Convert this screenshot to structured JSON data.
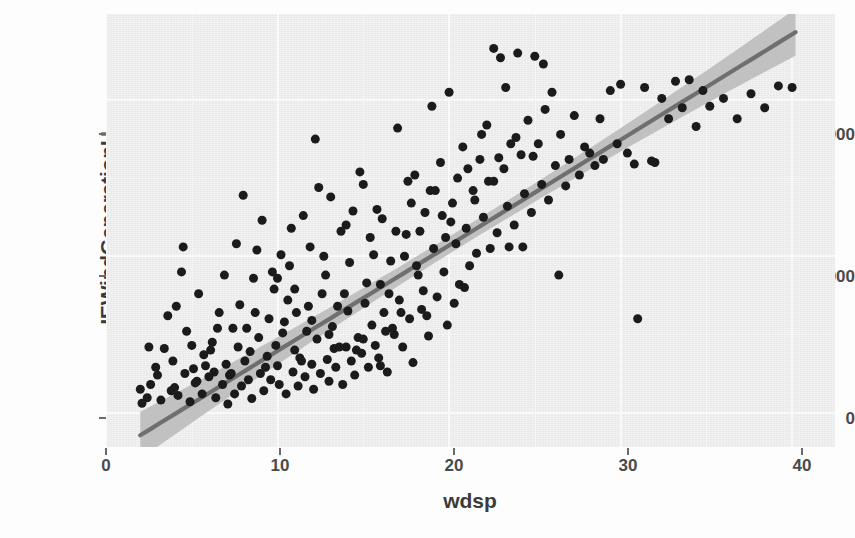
{
  "chart_data": {
    "type": "scatter",
    "title": "",
    "xlabel": "wdsp",
    "ylabel": "IEWindGenerationH",
    "xlim": [
      0,
      42.5
    ],
    "ylim": [
      -220,
      2550
    ],
    "xticks": [
      0,
      10,
      20,
      30,
      40
    ],
    "xticklabels": [
      "0",
      "10",
      "20",
      "30",
      "40"
    ],
    "yticks": [
      0,
      1000,
      2000
    ],
    "yticklabels": [
      "0",
      "1000",
      "2000"
    ],
    "grid": true,
    "legend": null,
    "panel_background": "#ececec",
    "grid_color": "#fafafa",
    "point_color": "#1b1b1b",
    "point_size": 9,
    "smooth": {
      "method": "lm",
      "line_color": "#6f6f6f",
      "ribbon_color": "#bdbdbd",
      "intercept": -280,
      "slope": 67.5,
      "x_start": 2.0,
      "x_end": 40.2,
      "se_min": 55,
      "se_max": 150
    },
    "points": [
      [
        2.0,
        150
      ],
      [
        2.1,
        60
      ],
      [
        2.4,
        95
      ],
      [
        2.6,
        180
      ],
      [
        3.0,
        240
      ],
      [
        3.2,
        80
      ],
      [
        3.6,
        620
      ],
      [
        3.9,
        330
      ],
      [
        4.0,
        160
      ],
      [
        4.2,
        110
      ],
      [
        4.4,
        900
      ],
      [
        4.6,
        250
      ],
      [
        4.9,
        70
      ],
      [
        5.0,
        430
      ],
      [
        5.2,
        190
      ],
      [
        5.4,
        760
      ],
      [
        5.6,
        120
      ],
      [
        5.8,
        300
      ],
      [
        6.0,
        230
      ],
      [
        6.2,
        450
      ],
      [
        6.4,
        95
      ],
      [
        6.6,
        640
      ],
      [
        6.8,
        180
      ],
      [
        7.0,
        310
      ],
      [
        7.1,
        55
      ],
      [
        7.3,
        250
      ],
      [
        7.5,
        120
      ],
      [
        7.7,
        420
      ],
      [
        7.9,
        170
      ],
      [
        8.0,
        1390
      ],
      [
        8.1,
        330
      ],
      [
        8.3,
        210
      ],
      [
        8.5,
        90
      ],
      [
        8.7,
        640
      ],
      [
        8.9,
        480
      ],
      [
        9.0,
        250
      ],
      [
        9.2,
        140
      ],
      [
        9.4,
        360
      ],
      [
        9.6,
        210
      ],
      [
        9.8,
        790
      ],
      [
        10.0,
        300
      ],
      [
        10.1,
        180
      ],
      [
        10.3,
        510
      ],
      [
        10.5,
        120
      ],
      [
        10.7,
        940
      ],
      [
        10.9,
        260
      ],
      [
        11.0,
        400
      ],
      [
        11.2,
        170
      ],
      [
        11.4,
        330
      ],
      [
        11.6,
        230
      ],
      [
        11.8,
        680
      ],
      [
        12.0,
        310
      ],
      [
        12.1,
        150
      ],
      [
        12.3,
        470
      ],
      [
        12.5,
        250
      ],
      [
        12.7,
        1000
      ],
      [
        12.9,
        340
      ],
      [
        13.0,
        200
      ],
      [
        13.2,
        550
      ],
      [
        13.4,
        290
      ],
      [
        13.6,
        420
      ],
      [
        13.8,
        180
      ],
      [
        14.0,
        1200
      ],
      [
        14.1,
        650
      ],
      [
        14.3,
        330
      ],
      [
        14.5,
        240
      ],
      [
        14.7,
        480
      ],
      [
        14.9,
        380
      ],
      [
        15.0,
        1460
      ],
      [
        15.1,
        700
      ],
      [
        15.3,
        290
      ],
      [
        15.5,
        560
      ],
      [
        15.7,
        430
      ],
      [
        15.9,
        350
      ],
      [
        16.0,
        820
      ],
      [
        16.2,
        640
      ],
      [
        16.4,
        260
      ],
      [
        16.6,
        970
      ],
      [
        16.8,
        500
      ],
      [
        17.0,
        1820
      ],
      [
        17.1,
        720
      ],
      [
        17.3,
        420
      ],
      [
        17.5,
        1140
      ],
      [
        17.7,
        600
      ],
      [
        17.9,
        320
      ],
      [
        18.0,
        1520
      ],
      [
        18.2,
        880
      ],
      [
        18.4,
        660
      ],
      [
        18.6,
        1280
      ],
      [
        18.8,
        490
      ],
      [
        19.0,
        1960
      ],
      [
        19.1,
        1050
      ],
      [
        19.3,
        740
      ],
      [
        19.5,
        1600
      ],
      [
        19.7,
        900
      ],
      [
        19.9,
        560
      ],
      [
        20.0,
        2050
      ],
      [
        20.2,
        1340
      ],
      [
        20.4,
        1080
      ],
      [
        20.6,
        820
      ],
      [
        20.8,
        1700
      ],
      [
        21.0,
        1180
      ],
      [
        21.2,
        940
      ],
      [
        21.4,
        1420
      ],
      [
        21.6,
        1020
      ],
      [
        21.8,
        1620
      ],
      [
        22.0,
        1250
      ],
      [
        22.2,
        1840
      ],
      [
        22.4,
        1050
      ],
      [
        22.6,
        1480
      ],
      [
        22.8,
        1150
      ],
      [
        23.0,
        2270
      ],
      [
        23.2,
        1560
      ],
      [
        23.4,
        1320
      ],
      [
        23.6,
        1720
      ],
      [
        23.8,
        1200
      ],
      [
        24.0,
        2300
      ],
      [
        24.2,
        1650
      ],
      [
        24.4,
        1400
      ],
      [
        24.6,
        1870
      ],
      [
        24.8,
        1280
      ],
      [
        25.0,
        2280
      ],
      [
        25.2,
        1720
      ],
      [
        25.4,
        1460
      ],
      [
        25.6,
        1940
      ],
      [
        25.8,
        1360
      ],
      [
        26.0,
        2050
      ],
      [
        26.2,
        1580
      ],
      [
        26.5,
        1780
      ],
      [
        26.8,
        1450
      ],
      [
        27.0,
        1620
      ],
      [
        27.3,
        1900
      ],
      [
        27.6,
        1520
      ],
      [
        27.9,
        1700
      ],
      [
        28.2,
        1660
      ],
      [
        28.5,
        1580
      ],
      [
        28.8,
        1880
      ],
      [
        29.0,
        1620
      ],
      [
        29.4,
        2060
      ],
      [
        29.8,
        1720
      ],
      [
        30.0,
        2100
      ],
      [
        30.4,
        1660
      ],
      [
        30.8,
        1590
      ],
      [
        31.0,
        600
      ],
      [
        31.4,
        2080
      ],
      [
        31.8,
        1610
      ],
      [
        32.0,
        1600
      ],
      [
        32.4,
        2010
      ],
      [
        32.8,
        1880
      ],
      [
        33.2,
        2120
      ],
      [
        33.6,
        1950
      ],
      [
        34.0,
        2130
      ],
      [
        34.4,
        1830
      ],
      [
        34.8,
        2060
      ],
      [
        35.2,
        1960
      ],
      [
        36.0,
        2010
      ],
      [
        36.8,
        1880
      ],
      [
        37.6,
        2040
      ],
      [
        38.4,
        1950
      ],
      [
        39.2,
        2090
      ],
      [
        40.0,
        2080
      ],
      [
        12.2,
        1750
      ],
      [
        13.1,
        1380
      ],
      [
        11.5,
        1260
      ],
      [
        9.1,
        1230
      ],
      [
        10.2,
        1010
      ],
      [
        8.6,
        860
      ],
      [
        7.4,
        540
      ],
      [
        6.1,
        400
      ],
      [
        5.1,
        280
      ],
      [
        14.8,
        1540
      ],
      [
        15.8,
        1300
      ],
      [
        16.9,
        1160
      ],
      [
        17.4,
        1000
      ],
      [
        18.9,
        1420
      ],
      [
        19.6,
        1260
      ],
      [
        20.5,
        1500
      ],
      [
        21.1,
        1560
      ],
      [
        22.9,
        1630
      ],
      [
        23.9,
        1760
      ],
      [
        12.8,
        880
      ],
      [
        13.9,
        760
      ],
      [
        11.1,
        640
      ],
      [
        10.6,
        720
      ],
      [
        9.5,
        600
      ],
      [
        14.2,
        960
      ],
      [
        15.4,
        1120
      ],
      [
        16.1,
        1240
      ],
      [
        17.8,
        1340
      ],
      [
        18.3,
        1160
      ],
      [
        19.2,
        1420
      ],
      [
        20.1,
        1220
      ],
      [
        21.5,
        1360
      ],
      [
        22.3,
        1480
      ],
      [
        24.9,
        1640
      ],
      [
        4.7,
        520
      ],
      [
        6.9,
        880
      ],
      [
        8.2,
        540
      ],
      [
        9.9,
        430
      ],
      [
        11.7,
        520
      ],
      [
        13.5,
        680
      ],
      [
        15.2,
        830
      ],
      [
        16.5,
        760
      ],
      [
        18.1,
        940
      ],
      [
        19.8,
        1120
      ],
      [
        3.4,
        410
      ],
      [
        5.7,
        370
      ],
      [
        7.8,
        690
      ],
      [
        10.4,
        580
      ],
      [
        12.6,
        760
      ],
      [
        14.6,
        400
      ],
      [
        16.3,
        520
      ],
      [
        17.2,
        640
      ],
      [
        20.9,
        800
      ],
      [
        23.5,
        1060
      ],
      [
        2.9,
        290
      ],
      [
        4.1,
        680
      ],
      [
        6.5,
        540
      ],
      [
        8.8,
        1040
      ],
      [
        10.8,
        1180
      ],
      [
        12.4,
        1440
      ],
      [
        14.4,
        1290
      ],
      [
        15.6,
        1010
      ],
      [
        17.6,
        1480
      ],
      [
        21.9,
        1780
      ],
      [
        3.8,
        140
      ],
      [
        5.3,
        200
      ],
      [
        7.2,
        240
      ],
      [
        9.3,
        290
      ],
      [
        11.3,
        350
      ],
      [
        13.3,
        410
      ],
      [
        15.0,
        470
      ],
      [
        16.7,
        540
      ],
      [
        18.7,
        620
      ],
      [
        20.3,
        700
      ],
      [
        2.5,
        420
      ],
      [
        4.5,
        1060
      ],
      [
        6.3,
        260
      ],
      [
        8.4,
        390
      ],
      [
        10.0,
        860
      ],
      [
        11.9,
        1060
      ],
      [
        13.7,
        1160
      ],
      [
        14.0,
        420
      ],
      [
        16.0,
        300
      ],
      [
        18.5,
        780
      ],
      [
        22.6,
        2330
      ],
      [
        23.3,
        2080
      ],
      [
        25.5,
        2230
      ],
      [
        24.3,
        1060
      ],
      [
        26.4,
        880
      ],
      [
        7.6,
        1080
      ],
      [
        9.7,
        900
      ],
      [
        11.0,
        790
      ],
      [
        12.0,
        590
      ],
      [
        13.0,
        500
      ]
    ]
  },
  "axis": {
    "y_title": "IEWindGenerationH",
    "x_title": "wdsp"
  }
}
